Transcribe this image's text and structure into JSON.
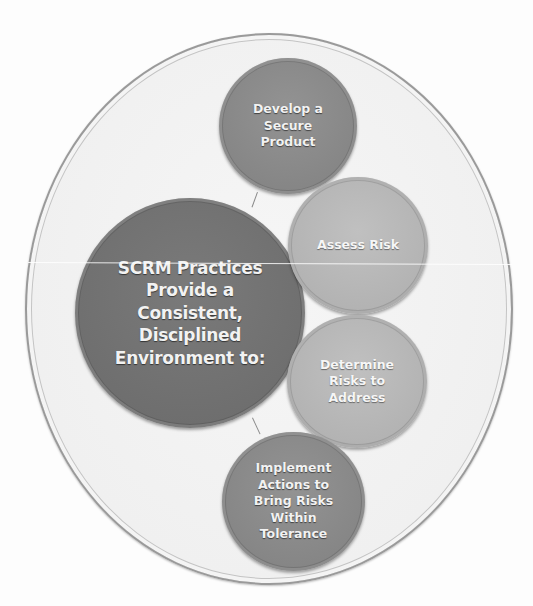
{
  "diagram": {
    "type": "hub-and-spoke circle diagram",
    "center": {
      "label": "SCRM Practices\nProvide a\nConsistent,\nDisciplined\nEnvironment to:",
      "color": "#6e6e6e"
    },
    "nodes": [
      {
        "id": "develop",
        "label": "Develop a\nSecure\nProduct",
        "color": "#858585"
      },
      {
        "id": "assess",
        "label": "Assess Risk",
        "color": "#b2b2b2"
      },
      {
        "id": "determine",
        "label": "Determine\nRisks to\nAddress",
        "color": "#b2b2b2"
      },
      {
        "id": "implement",
        "label": "Implement\nActions to\nBring Risks\nWithin\nTolerance",
        "color": "#858585"
      }
    ],
    "container_color": "#f0f0f0"
  }
}
